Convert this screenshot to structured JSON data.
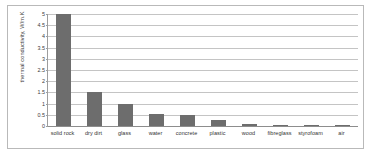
{
  "chart_data": {
    "type": "bar",
    "title": "",
    "xlabel": "",
    "ylabel": "thermal conductivity, W/m.K",
    "ylim": [
      0,
      5
    ],
    "ytick_labels": [
      "5",
      "4.5",
      "4",
      "3.5",
      "3",
      "2.5",
      "2",
      "1.5",
      "1",
      "0.5",
      "0"
    ],
    "ytick_values": [
      5,
      4.5,
      4,
      3.5,
      3,
      2.5,
      2,
      1.5,
      1,
      0.5,
      0
    ],
    "grid": true,
    "legend": false,
    "bar_color": "#6d6d6d",
    "categories": [
      "solid rock",
      "dry dirt",
      "glass",
      "water",
      "concrete",
      "plastic",
      "wood",
      "fibreglass",
      "styrofoam",
      "air"
    ],
    "values": [
      5,
      1.5,
      1,
      0.55,
      0.48,
      0.25,
      0.11,
      0.04,
      0.035,
      0.03
    ]
  }
}
